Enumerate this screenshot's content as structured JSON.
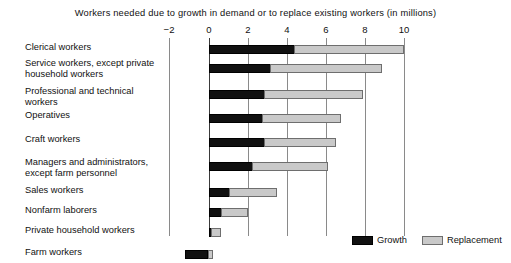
{
  "chart_data": {
    "type": "bar",
    "orientation": "horizontal",
    "stacked": true,
    "title": "Workers needed due to growth in demand or to replace existing workers (in millions)",
    "xlabel": "",
    "ylabel": "",
    "xlim": [
      -2,
      10
    ],
    "xticks": [
      -2,
      0,
      2,
      4,
      6,
      8,
      10
    ],
    "xtick_labels": [
      "−2",
      "0",
      "2",
      "4",
      "6",
      "8",
      "10"
    ],
    "grid": true,
    "legend_position": "bottom-right",
    "categories": [
      "Clerical workers",
      "Service workers, except private household workers",
      "Professional and technical workers",
      "Operatives",
      "Craft workers",
      "Managers and administrators, except farm personnel",
      "Sales workers",
      "Nonfarm laborers",
      "Private household workers",
      "Farm workers"
    ],
    "series": [
      {
        "name": "Growth",
        "color": "#111111",
        "values": [
          4.4,
          3.2,
          2.9,
          2.8,
          2.9,
          2.3,
          1.1,
          0.7,
          0.2,
          -1.2
        ]
      },
      {
        "name": "Replacement",
        "color": "#c9c9c9",
        "values": [
          5.6,
          5.7,
          5.0,
          4.0,
          3.6,
          3.8,
          2.4,
          1.3,
          0.45,
          0.25
        ]
      }
    ],
    "totals": [
      10.0,
      8.9,
      7.9,
      6.8,
      6.5,
      6.1,
      3.5,
      2.0,
      0.65,
      -0.95
    ]
  },
  "legend": {
    "entries": [
      {
        "label": "Growth",
        "swatch": "growth"
      },
      {
        "label": "Replacement",
        "swatch": "replacement"
      }
    ]
  }
}
